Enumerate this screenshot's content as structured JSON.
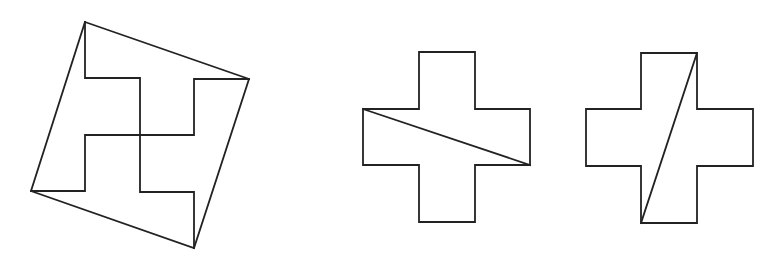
{
  "diagram": {
    "background": "#ffffff",
    "stroke_color": "#222222",
    "stroke_width": 1.8,
    "figures": [
      {
        "id": "tilted-square-pinwheel",
        "label": "",
        "outline": [
          [
            85,
            22
          ],
          [
            249,
            79
          ],
          [
            194,
            248
          ],
          [
            31,
            191
          ]
        ],
        "inner_paths": [
          [
            [
              85,
              22
            ],
            [
              85,
              78
            ],
            [
              140,
              78
            ],
            [
              140,
              192
            ],
            [
              194,
              192
            ],
            [
              194,
              248
            ]
          ],
          [
            [
              249,
              79
            ],
            [
              194,
              79
            ],
            [
              194,
              135
            ],
            [
              85,
              135
            ],
            [
              85,
              191
            ],
            [
              31,
              191
            ]
          ]
        ]
      },
      {
        "id": "cross-horizontal-cut",
        "label": "",
        "outline": [
          [
            419,
            52
          ],
          [
            475,
            52
          ],
          [
            475,
            109
          ],
          [
            530,
            109
          ],
          [
            530,
            165
          ],
          [
            475,
            165
          ],
          [
            475,
            222
          ],
          [
            419,
            222
          ],
          [
            419,
            165
          ],
          [
            363,
            165
          ],
          [
            363,
            109
          ],
          [
            419,
            109
          ]
        ],
        "cut_lines": [
          [
            [
              363,
              109
            ],
            [
              530,
              165
            ]
          ]
        ]
      },
      {
        "id": "cross-vertical-cut",
        "label": "",
        "outline": [
          [
            641,
            53
          ],
          [
            697,
            53
          ],
          [
            697,
            109
          ],
          [
            753,
            109
          ],
          [
            753,
            166
          ],
          [
            697,
            166
          ],
          [
            697,
            223
          ],
          [
            641,
            223
          ],
          [
            641,
            166
          ],
          [
            586,
            166
          ],
          [
            586,
            109
          ],
          [
            641,
            109
          ]
        ],
        "cut_lines": [
          [
            [
              697,
              53
            ],
            [
              641,
              223
            ]
          ]
        ]
      }
    ]
  }
}
